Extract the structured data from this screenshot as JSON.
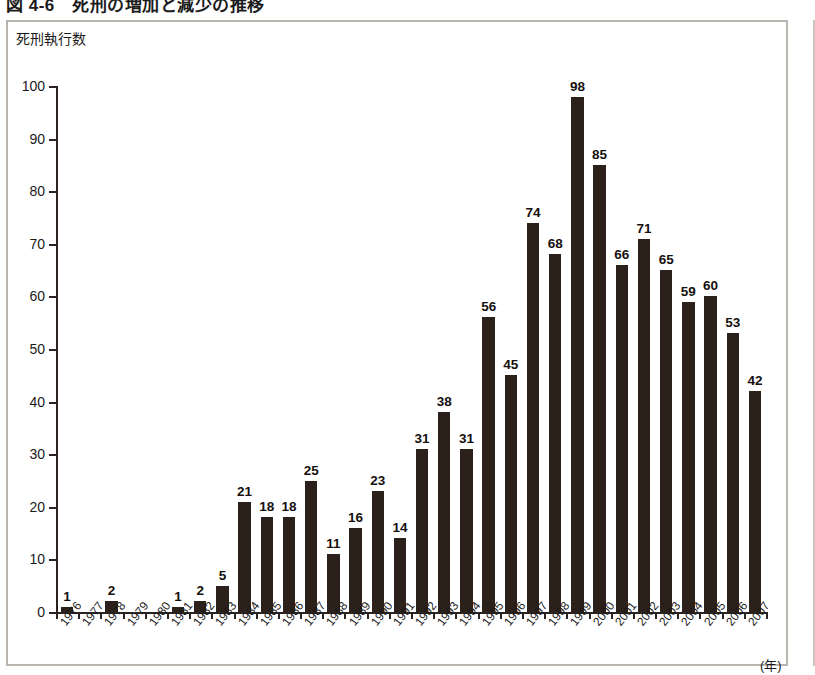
{
  "figure": {
    "caption": "図 4-6　死刑の増加と減少の推移"
  },
  "chart_data": {
    "type": "bar",
    "title": "図 4-6　死刑の増加と減少の推移",
    "ylabel": "死刑執行数",
    "xlabel": "",
    "x_unit_label": "(年)",
    "ylim": [
      0,
      100
    ],
    "ytick_step": 10,
    "yticks": [
      0,
      10,
      20,
      30,
      40,
      50,
      60,
      70,
      80,
      90,
      100
    ],
    "ytick_labels": [
      "0",
      "10",
      "20",
      "30",
      "40",
      "50",
      "60",
      "70",
      "80",
      "90",
      "100"
    ],
    "grid": false,
    "legend": null,
    "bar_color": "#2c201a",
    "axis_color": "#2a2320",
    "categories": [
      "1976",
      "1977",
      "1978",
      "1979",
      "1980",
      "1981",
      "1982",
      "1983",
      "1984",
      "1985",
      "1986",
      "1987",
      "1988",
      "1989",
      "1990",
      "1991",
      "1992",
      "1993",
      "1994",
      "1995",
      "1996",
      "1997",
      "1998",
      "1999",
      "2000",
      "2001",
      "2002",
      "2003",
      "2004",
      "2005",
      "2006",
      "2007"
    ],
    "values": [
      1,
      0,
      2,
      0,
      0,
      1,
      2,
      5,
      21,
      18,
      18,
      25,
      11,
      16,
      23,
      14,
      31,
      38,
      31,
      56,
      45,
      74,
      68,
      98,
      85,
      66,
      71,
      65,
      59,
      60,
      53,
      42
    ],
    "data_labels": [
      "1",
      "",
      "2",
      "",
      "",
      "1",
      "2",
      "5",
      "21",
      "18",
      "18",
      "25",
      "11",
      "16",
      "23",
      "14",
      "31",
      "38",
      "31",
      "56",
      "45",
      "74",
      "68",
      "98",
      "85",
      "66",
      "71",
      "65",
      "59",
      "60",
      "53",
      "42"
    ]
  }
}
